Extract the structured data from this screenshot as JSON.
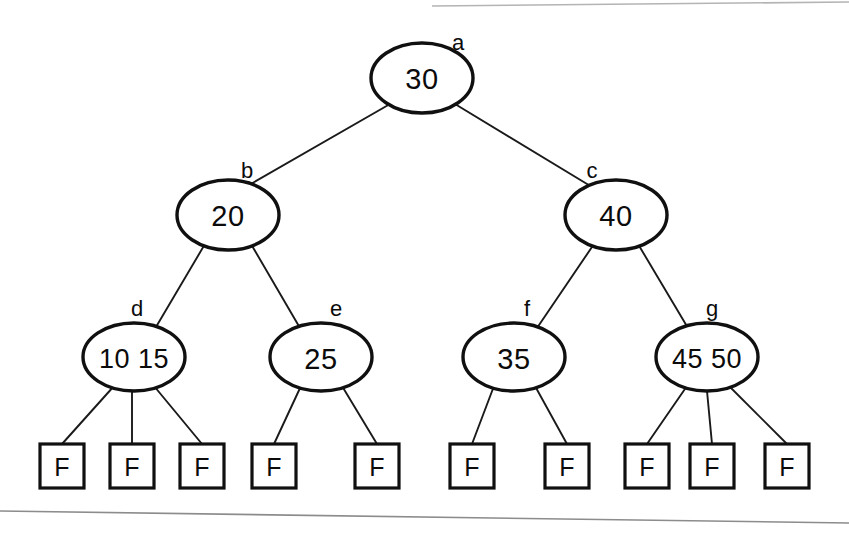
{
  "figure": {
    "type": "tree-diagram",
    "background_color": "#ffffff",
    "ink_color": "#101010",
    "rule_color": "#9a9a9a"
  },
  "nodes": [
    {
      "id": "a",
      "label": "a",
      "keys": [
        "30"
      ],
      "key_text": "30",
      "level": 0,
      "cx": 422,
      "cy": 78,
      "rx": 51,
      "ry": 35,
      "label_x": 458,
      "label_y": 42
    },
    {
      "id": "b",
      "label": "b",
      "keys": [
        "20"
      ],
      "key_text": "20",
      "level": 1,
      "cx": 228,
      "cy": 215,
      "rx": 51,
      "ry": 35,
      "label_x": 247,
      "label_y": 170
    },
    {
      "id": "c",
      "label": "c",
      "keys": [
        "40"
      ],
      "key_text": "40",
      "level": 1,
      "cx": 616,
      "cy": 215,
      "rx": 51,
      "ry": 35,
      "label_x": 592,
      "label_y": 170
    },
    {
      "id": "d",
      "label": "d",
      "keys": [
        "10",
        "15"
      ],
      "key_text": "10    15",
      "level": 2,
      "cx": 134,
      "cy": 357,
      "rx": 51,
      "ry": 34,
      "label_x": 137,
      "label_y": 308
    },
    {
      "id": "e",
      "label": "e",
      "keys": [
        "25"
      ],
      "key_text": "25",
      "level": 2,
      "cx": 321,
      "cy": 357,
      "rx": 51,
      "ry": 34,
      "label_x": 336,
      "label_y": 308
    },
    {
      "id": "f",
      "label": "f",
      "keys": [
        "35"
      ],
      "key_text": "35",
      "level": 2,
      "cx": 514,
      "cy": 357,
      "rx": 51,
      "ry": 34,
      "label_x": 527,
      "label_y": 308
    },
    {
      "id": "g",
      "label": "g",
      "keys": [
        "45",
        "50"
      ],
      "key_text": "45   50",
      "level": 2,
      "cx": 707,
      "cy": 357,
      "rx": 51,
      "ry": 34,
      "label_x": 712,
      "label_y": 308
    }
  ],
  "leaves": [
    {
      "id": "leaf1",
      "text": "F",
      "parent": "d",
      "x": 40,
      "y": 444,
      "w": 44,
      "h": 44
    },
    {
      "id": "leaf2",
      "text": "F",
      "parent": "d",
      "x": 110,
      "y": 444,
      "w": 44,
      "h": 44
    },
    {
      "id": "leaf3",
      "text": "F",
      "parent": "d",
      "x": 180,
      "y": 444,
      "w": 44,
      "h": 44
    },
    {
      "id": "leaf4",
      "text": "F",
      "parent": "e",
      "x": 252,
      "y": 444,
      "w": 44,
      "h": 44
    },
    {
      "id": "leaf5",
      "text": "F",
      "parent": "e",
      "x": 355,
      "y": 444,
      "w": 44,
      "h": 44
    },
    {
      "id": "leaf6",
      "text": "F",
      "parent": "f",
      "x": 450,
      "y": 444,
      "w": 44,
      "h": 44
    },
    {
      "id": "leaf7",
      "text": "F",
      "parent": "f",
      "x": 545,
      "y": 444,
      "w": 44,
      "h": 44
    },
    {
      "id": "leaf8",
      "text": "F",
      "parent": "g",
      "x": 625,
      "y": 444,
      "w": 44,
      "h": 44
    },
    {
      "id": "leaf9",
      "text": "F",
      "parent": "g",
      "x": 690,
      "y": 444,
      "w": 44,
      "h": 44
    },
    {
      "id": "leaf10",
      "text": "F",
      "parent": "g",
      "x": 765,
      "y": 444,
      "w": 44,
      "h": 44
    }
  ],
  "edges": [
    {
      "from": "a",
      "to": "b",
      "x1": 390,
      "y1": 104,
      "x2": 249,
      "y2": 185
    },
    {
      "from": "a",
      "to": "c",
      "x1": 455,
      "y1": 104,
      "x2": 592,
      "y2": 187
    },
    {
      "from": "b",
      "to": "d",
      "x1": 205,
      "y1": 244,
      "x2": 156,
      "y2": 327
    },
    {
      "from": "b",
      "to": "e",
      "x1": 251,
      "y1": 244,
      "x2": 300,
      "y2": 328
    },
    {
      "from": "c",
      "to": "f",
      "x1": 594,
      "y1": 244,
      "x2": 537,
      "y2": 328
    },
    {
      "from": "c",
      "to": "g",
      "x1": 638,
      "y1": 244,
      "x2": 688,
      "y2": 328
    },
    {
      "from": "d",
      "to": "leaf1",
      "x1": 114,
      "y1": 386,
      "x2": 62,
      "y2": 444
    },
    {
      "from": "d",
      "to": "leaf2",
      "x1": 132,
      "y1": 391,
      "x2": 132,
      "y2": 444
    },
    {
      "from": "d",
      "to": "leaf3",
      "x1": 154,
      "y1": 386,
      "x2": 202,
      "y2": 444
    },
    {
      "from": "e",
      "to": "leaf4",
      "x1": 301,
      "y1": 386,
      "x2": 274,
      "y2": 444
    },
    {
      "from": "e",
      "to": "leaf5",
      "x1": 342,
      "y1": 386,
      "x2": 377,
      "y2": 444
    },
    {
      "from": "f",
      "to": "leaf6",
      "x1": 494,
      "y1": 386,
      "x2": 472,
      "y2": 444
    },
    {
      "from": "f",
      "to": "leaf7",
      "x1": 535,
      "y1": 386,
      "x2": 567,
      "y2": 444
    },
    {
      "from": "g",
      "to": "leaf8",
      "x1": 687,
      "y1": 386,
      "x2": 647,
      "y2": 444
    },
    {
      "from": "g",
      "to": "leaf9",
      "x1": 707,
      "y1": 391,
      "x2": 712,
      "y2": 444
    },
    {
      "from": "g",
      "to": "leaf10",
      "x1": 729,
      "y1": 386,
      "x2": 787,
      "y2": 444
    }
  ],
  "rules": [
    {
      "id": "top-rule",
      "x1": 432,
      "y1": 6,
      "x2": 849,
      "y2": 2,
      "color": "#b4b4b4"
    },
    {
      "id": "bottom-rule",
      "x1": 0,
      "y1": 511,
      "x2": 849,
      "y2": 523,
      "color": "#8c8c8c"
    }
  ]
}
